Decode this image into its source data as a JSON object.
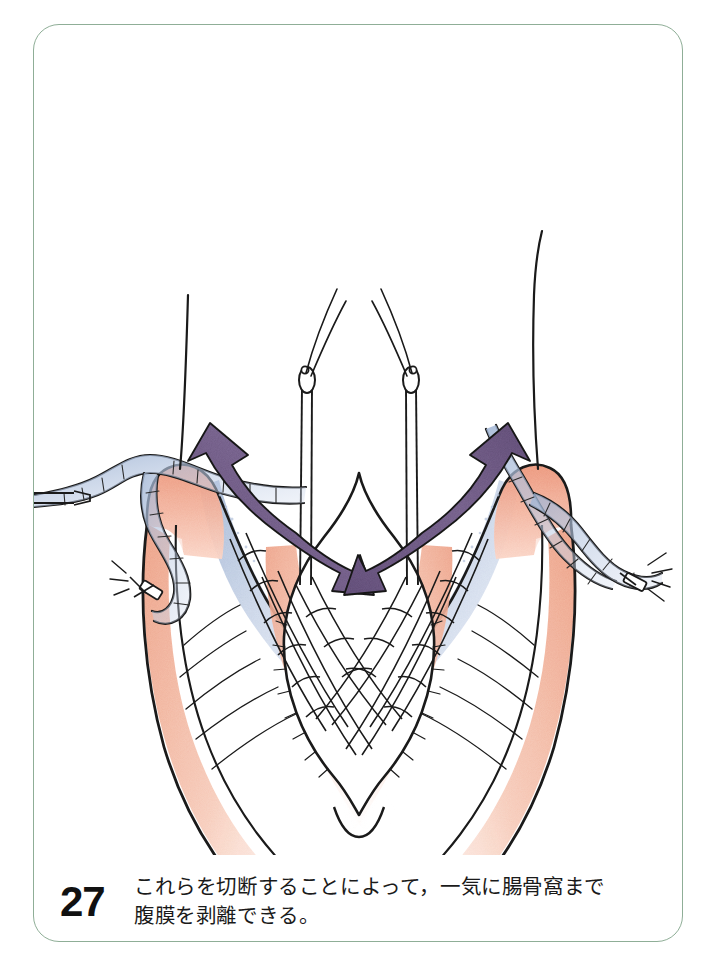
{
  "figure": {
    "number": "27",
    "caption_lines": [
      "これらを切断することによって，一気に腸骨窩まで",
      "腹膜を剥離できる。"
    ],
    "caption_full": "これらを切断することによって，一気に腸骨窩まで腹膜を剥離できる。",
    "frame_border_color": "#8fae97",
    "background_color": "#ffffff"
  },
  "illustration": {
    "title": "anatomical-surgical-drawing-pelvic-peritoneum",
    "description": "Hand-drawn surgical anatomy illustration: bilateral peritoneal flaps retracted outward, central bladder-like dome, two needle-holder clamps with suture threads above, clipped vessels laterally, and two purple arrows indicating dissection direction toward the iliac fossa.",
    "colors": {
      "flesh": "#f2b29a",
      "flesh_light": "#f7cdbb",
      "flesh_pale": "#fbe3d9",
      "blue_shade": "#a9bcd8",
      "blue_shade_light": "#c6d3e6",
      "arrow_purple": "#6f5a86",
      "arrow_purple_light": "#8b77a0",
      "ink": "#1a1a1a",
      "vessel_outline": "#2b2b2b"
    },
    "elements": [
      {
        "name": "left-peritoneal-flap",
        "kind": "tissue-flap",
        "side": "left"
      },
      {
        "name": "right-peritoneal-flap",
        "kind": "tissue-flap",
        "side": "right"
      },
      {
        "name": "central-bladder-dome",
        "kind": "organ"
      },
      {
        "name": "left-dissection-arrow",
        "kind": "arrow",
        "direction": "up-left",
        "color": "#6f5a86"
      },
      {
        "name": "right-dissection-arrow",
        "kind": "arrow",
        "direction": "up-right",
        "color": "#6f5a86"
      },
      {
        "name": "left-clamp",
        "kind": "instrument"
      },
      {
        "name": "right-clamp",
        "kind": "instrument"
      },
      {
        "name": "left-suture-thread",
        "kind": "suture"
      },
      {
        "name": "right-suture-thread",
        "kind": "suture"
      },
      {
        "name": "left-clipped-vessel",
        "kind": "vessel"
      },
      {
        "name": "right-clipped-vessel",
        "kind": "vessel"
      },
      {
        "name": "left-surgical-clip",
        "kind": "clip"
      },
      {
        "name": "right-surgical-clip",
        "kind": "clip"
      }
    ]
  }
}
